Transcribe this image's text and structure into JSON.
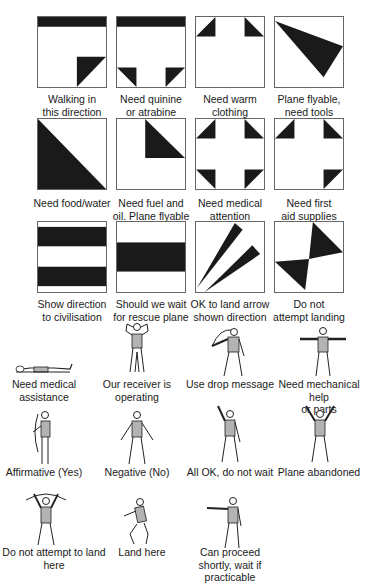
{
  "colors": {
    "fill": "#1a1a1a",
    "border": "#666666",
    "figure_shirt": "#b3b3b3",
    "line": "#222222"
  },
  "ground_signals": [
    {
      "id": "walking",
      "label": "Walking in\nthis direction"
    },
    {
      "id": "quinine",
      "label": "Need quinine\nor atrabine"
    },
    {
      "id": "warm-clothing",
      "label": "Need warm\nclothing"
    },
    {
      "id": "plane-flyable-tools",
      "label": "Plane flyable,\nneed tools"
    },
    {
      "id": "food-water",
      "label": "Need food/water"
    },
    {
      "id": "fuel-oil",
      "label": "Need fuel and\noil. Plane flyable"
    },
    {
      "id": "medical-attention",
      "label": "Need medical\nattention"
    },
    {
      "id": "first-aid",
      "label": "Need first\naid supplies"
    },
    {
      "id": "direction-civilisation",
      "label": "Show direction\nto civilisation"
    },
    {
      "id": "wait-rescue",
      "label": "Should we wait\nfor rescue plane"
    },
    {
      "id": "ok-land-arrow",
      "label": "OK to land arrow\nshown direction"
    },
    {
      "id": "do-not-land",
      "label": "Do not\nattempt landing"
    }
  ],
  "body_signals": [
    {
      "id": "medical-assistance",
      "label": "Need medical\nassistance"
    },
    {
      "id": "receiver-operating",
      "label": "Our receiver is\noperating"
    },
    {
      "id": "drop-message",
      "label": "Use drop message"
    },
    {
      "id": "mechanical-help",
      "label": "Need mechanical help\nor parts"
    },
    {
      "id": "affirmative",
      "label": "Affirmative (Yes)"
    },
    {
      "id": "negative",
      "label": "Negative (No)"
    },
    {
      "id": "all-ok",
      "label": "All OK, do not wait"
    },
    {
      "id": "plane-abandoned",
      "label": "Plane abandoned"
    },
    {
      "id": "do-not-land-here",
      "label": "Do not attempt to land here"
    },
    {
      "id": "land-here",
      "label": "Land here"
    },
    {
      "id": "proceed-shortly",
      "label": "Can proceed\nshortly, wait if practicable"
    }
  ]
}
